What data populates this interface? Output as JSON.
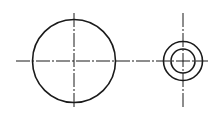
{
  "drawing": {
    "background": "#ffffff",
    "stroke_color": "#1a1a1a",
    "horizontal_centerline": {
      "x1": 16,
      "y": 61,
      "x2": 208,
      "dash": "14 2 2 2"
    },
    "left_view": {
      "center": [
        74,
        61
      ],
      "circle_radius": 41.5,
      "vertical_centerline": {
        "y1": 13,
        "y2": 107
      }
    },
    "right_view": {
      "center": [
        183,
        61
      ],
      "outer_radius": 19.5,
      "inner_radius": 12,
      "vertical_centerline": {
        "y1": 13,
        "y2": 108
      }
    }
  }
}
